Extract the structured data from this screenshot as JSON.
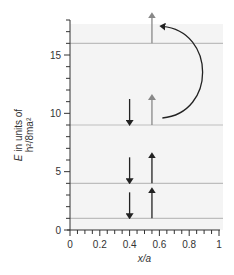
{
  "chart_data": {
    "type": "diagram",
    "title": "",
    "xlabel": "x/a",
    "ylabel_line1": "E in units of",
    "ylabel_line2": "h²/8ma²",
    "xlim": [
      0,
      1
    ],
    "ylim": [
      0,
      18
    ],
    "x_ticks": [
      0,
      0.2,
      0.4,
      0.6,
      0.8,
      1
    ],
    "x_tick_labels": [
      "0",
      "0.2",
      "0.4",
      "0.6",
      "0.8",
      "1"
    ],
    "y_ticks": [
      0,
      5,
      10,
      15
    ],
    "y_tick_labels": [
      "0",
      "5",
      "10",
      "15"
    ],
    "energy_levels": [
      1,
      4,
      9,
      16
    ],
    "spin_arrows": [
      {
        "level": 1,
        "x": 0.4,
        "direction": "down",
        "color": "#222222"
      },
      {
        "level": 1,
        "x": 0.55,
        "direction": "up",
        "color": "#222222"
      },
      {
        "level": 4,
        "x": 0.4,
        "direction": "down",
        "color": "#222222"
      },
      {
        "level": 4,
        "x": 0.55,
        "direction": "up",
        "color": "#222222"
      },
      {
        "level": 9,
        "x": 0.4,
        "direction": "down",
        "color": "#222222"
      },
      {
        "level": 9,
        "x": 0.55,
        "direction": "up",
        "color": "#888888"
      },
      {
        "level": 16,
        "x": 0.55,
        "direction": "up",
        "color": "#888888"
      }
    ],
    "transition": {
      "from_level": 9,
      "to_level": 16,
      "description": "curved arrow showing electron excitation from n=3 to n=4"
    },
    "colors": {
      "plot_background": "#f4f4f4",
      "level_line": "#bdbdbd",
      "axis": "#333333",
      "arrow_dark": "#222222",
      "arrow_grey": "#888888"
    }
  }
}
